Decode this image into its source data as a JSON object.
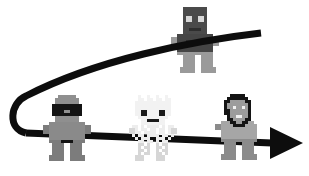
{
  "scene": {
    "title": "Pixel-art characters on a looping arrow path",
    "background_color": "#ffffff",
    "width": 309,
    "height": 176
  },
  "path": {
    "name": "looping-arrow",
    "stroke_color": "#0d0d0d",
    "stroke_width": 7,
    "description": "Thick black line starting at upper right, sweeping left and curving down through a U-turn at the far left, then running rightwards to an arrowhead at the right edge",
    "upper_segment": {
      "start_x": 261,
      "start_y": 33,
      "end_x": 26,
      "end_y": 96
    },
    "u_turn": {
      "center_x": 16,
      "center_y": 116,
      "radius": 20
    },
    "lower_segment": {
      "start_x": 26,
      "start_y": 133,
      "end_x": 272,
      "end_y": 143
    },
    "arrow_head": {
      "tip_x": 303,
      "tip_y": 143,
      "base_x": 270,
      "half_height": 16
    }
  },
  "characters": [
    {
      "name": "dark-figure-on-upper-curve",
      "label": "dark figure",
      "x": 171,
      "y": 7,
      "scale": 3,
      "head_color": "#4a4a4a",
      "body_color": "#454545",
      "limb_color": "#9a9a9a",
      "eye_color": "#d8d8d8"
    },
    {
      "name": "gray-visor-figure",
      "label": "gray visor figure",
      "x": 43,
      "y": 95,
      "scale": 3,
      "head_color": "#8f8f8f",
      "body_color": "#8a8a8a",
      "limb_color": "#7c7c7c",
      "eye_color": "#1a1a1a"
    },
    {
      "name": "white-speckled-figure",
      "label": "white speckled figure",
      "x": 129,
      "y": 95,
      "scale": 3,
      "head_color": "#f2f2f2",
      "body_color": "#ededed",
      "limb_color": "#d6d6d6",
      "eye_color": "#1a1a1a"
    },
    {
      "name": "dark-haired-figure",
      "label": "dark haired figure",
      "x": 215,
      "y": 94,
      "scale": 3,
      "head_color": "#9c9c9c",
      "body_color": "#a6a6a6",
      "limb_color": "#8b8b8b",
      "eye_color": "#f0f0f0"
    }
  ]
}
